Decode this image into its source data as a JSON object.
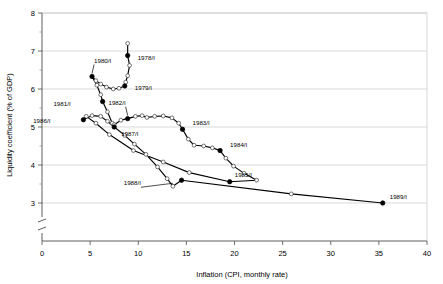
{
  "chart_data": {
    "type": "line",
    "title": "",
    "xlabel": "Inflation (CPI, monthly rate)",
    "ylabel": "Liquidity coefficient (% of GDP)",
    "xlim": [
      0,
      40
    ],
    "ylim": [
      3,
      8
    ],
    "y_axis_break": true,
    "grid": "horizontal",
    "legend": "none",
    "xticks": [
      0,
      5,
      10,
      15,
      20,
      25,
      30,
      35,
      40
    ],
    "xtick_labels": [
      "0",
      "5",
      "10",
      "15",
      "20",
      "25",
      "30",
      "35",
      "40"
    ],
    "yticks": [
      3,
      4,
      5,
      6,
      7,
      8
    ],
    "ytick_labels": [
      "3",
      "4",
      "5",
      "6",
      "7",
      "8"
    ],
    "series": [
      {
        "name": "Liquidity coefficient vs inflation (quarterly path 1978/I-1989/I)",
        "marker_open": "open circle (quarterly observations)",
        "marker_filled": "filled square (first quarter of year, labelled)",
        "points": [
          {
            "x": 8.9,
            "y": 7.2,
            "marker": "open",
            "label": ""
          },
          {
            "x": 8.9,
            "y": 6.88,
            "marker": "filled",
            "label": "1978/I"
          },
          {
            "x": 9.1,
            "y": 6.62,
            "marker": "open",
            "label": ""
          },
          {
            "x": 8.9,
            "y": 6.35,
            "marker": "open",
            "label": ""
          },
          {
            "x": 8.7,
            "y": 6.18,
            "marker": "open",
            "label": ""
          },
          {
            "x": 8.6,
            "y": 6.08,
            "marker": "filled",
            "label": "1979/I"
          },
          {
            "x": 8.0,
            "y": 6.02,
            "marker": "open",
            "label": ""
          },
          {
            "x": 7.4,
            "y": 6.0,
            "marker": "open",
            "label": ""
          },
          {
            "x": 6.7,
            "y": 6.05,
            "marker": "open",
            "label": ""
          },
          {
            "x": 6.1,
            "y": 6.13,
            "marker": "open",
            "label": ""
          },
          {
            "x": 5.6,
            "y": 6.22,
            "marker": "open",
            "label": ""
          },
          {
            "x": 5.2,
            "y": 6.33,
            "marker": "filled",
            "label": "1980/I"
          },
          {
            "x": 5.7,
            "y": 6.1,
            "marker": "open",
            "label": ""
          },
          {
            "x": 6.1,
            "y": 5.85,
            "marker": "open",
            "label": ""
          },
          {
            "x": 6.3,
            "y": 5.67,
            "marker": "filled",
            "label": "1981/I"
          },
          {
            "x": 6.8,
            "y": 5.4,
            "marker": "open",
            "label": ""
          },
          {
            "x": 7.3,
            "y": 5.1,
            "marker": "open",
            "label": ""
          },
          {
            "x": 7.5,
            "y": 5.06,
            "marker": "open",
            "label": ""
          },
          {
            "x": 8.2,
            "y": 5.18,
            "marker": "open",
            "label": ""
          },
          {
            "x": 8.9,
            "y": 5.22,
            "marker": "filled",
            "label": "1982/I"
          },
          {
            "x": 9.7,
            "y": 5.28,
            "marker": "open",
            "label": ""
          },
          {
            "x": 10.4,
            "y": 5.3,
            "marker": "open",
            "label": ""
          },
          {
            "x": 10.9,
            "y": 5.25,
            "marker": "open",
            "label": ""
          },
          {
            "x": 11.7,
            "y": 5.28,
            "marker": "open",
            "label": ""
          },
          {
            "x": 12.6,
            "y": 5.29,
            "marker": "open",
            "label": ""
          },
          {
            "x": 13.5,
            "y": 5.24,
            "marker": "open",
            "label": ""
          },
          {
            "x": 14.2,
            "y": 5.1,
            "marker": "open",
            "label": ""
          },
          {
            "x": 14.6,
            "y": 4.94,
            "marker": "filled",
            "label": "1983/I"
          },
          {
            "x": 15.2,
            "y": 4.68,
            "marker": "open",
            "label": ""
          },
          {
            "x": 15.8,
            "y": 4.52,
            "marker": "open",
            "label": ""
          },
          {
            "x": 16.8,
            "y": 4.5,
            "marker": "open",
            "label": ""
          },
          {
            "x": 17.7,
            "y": 4.45,
            "marker": "open",
            "label": ""
          },
          {
            "x": 18.5,
            "y": 4.38,
            "marker": "filled",
            "label": "1984/I"
          },
          {
            "x": 19.1,
            "y": 4.18,
            "marker": "open",
            "label": ""
          },
          {
            "x": 19.9,
            "y": 3.97,
            "marker": "open",
            "label": ""
          },
          {
            "x": 21.0,
            "y": 3.78,
            "marker": "open",
            "label": ""
          },
          {
            "x": 22.3,
            "y": 3.6,
            "marker": "open",
            "label": ""
          },
          {
            "x": 19.5,
            "y": 3.56,
            "marker": "filled",
            "label": "1985/I"
          },
          {
            "x": 15.3,
            "y": 3.8,
            "marker": "open",
            "label": ""
          },
          {
            "x": 12.6,
            "y": 4.08,
            "marker": "open",
            "label": ""
          },
          {
            "x": 9.5,
            "y": 4.38,
            "marker": "open",
            "label": ""
          },
          {
            "x": 7.0,
            "y": 4.8,
            "marker": "open",
            "label": ""
          },
          {
            "x": 5.6,
            "y": 5.1,
            "marker": "open",
            "label": ""
          },
          {
            "x": 4.6,
            "y": 5.28,
            "marker": "open",
            "label": ""
          },
          {
            "x": 4.3,
            "y": 5.19,
            "marker": "filled",
            "label": "1986/I"
          },
          {
            "x": 5.2,
            "y": 5.3,
            "marker": "open",
            "label": ""
          },
          {
            "x": 6.1,
            "y": 5.28,
            "marker": "open",
            "label": ""
          },
          {
            "x": 6.8,
            "y": 5.15,
            "marker": "open",
            "label": ""
          },
          {
            "x": 7.5,
            "y": 5.0,
            "marker": "filled",
            "label": "1987/I"
          },
          {
            "x": 8.6,
            "y": 4.78,
            "marker": "open",
            "label": ""
          },
          {
            "x": 9.6,
            "y": 4.55,
            "marker": "open",
            "label": ""
          },
          {
            "x": 10.8,
            "y": 4.28,
            "marker": "open",
            "label": ""
          },
          {
            "x": 12.0,
            "y": 3.95,
            "marker": "open",
            "label": ""
          },
          {
            "x": 13.0,
            "y": 3.64,
            "marker": "open",
            "label": ""
          },
          {
            "x": 13.6,
            "y": 3.44,
            "marker": "open",
            "label": "1988/I"
          },
          {
            "x": 14.5,
            "y": 3.6,
            "marker": "filled",
            "label": ""
          },
          {
            "x": 25.9,
            "y": 3.24,
            "marker": "open",
            "label": ""
          },
          {
            "x": 35.4,
            "y": 3.0,
            "marker": "filled",
            "label": "1989/I"
          }
        ]
      }
    ],
    "annotations": [
      {
        "text": "1978/I",
        "x": 8.9,
        "y": 6.88,
        "dx": 10,
        "dy": 2,
        "leader": false
      },
      {
        "text": "1979/I",
        "x": 8.6,
        "y": 6.08,
        "dx": 10,
        "dy": 2,
        "leader": false
      },
      {
        "text": "1980/I",
        "x": 5.2,
        "y": 6.33,
        "dx": 2,
        "dy": -16,
        "leader": true
      },
      {
        "text": "1981/I",
        "x": 6.3,
        "y": 5.67,
        "dx": -32,
        "dy": 2,
        "leader": false
      },
      {
        "text": "1982/I",
        "x": 8.9,
        "y": 5.22,
        "dx": -2,
        "dy": -16,
        "leader": true
      },
      {
        "text": "1983/I",
        "x": 14.6,
        "y": 4.94,
        "dx": 10,
        "dy": -6,
        "leader": false
      },
      {
        "text": "1984/I",
        "x": 18.5,
        "y": 4.38,
        "dx": 10,
        "dy": -6,
        "leader": false
      },
      {
        "text": "1985/I",
        "x": 19.5,
        "y": 3.56,
        "dx": 5,
        "dy": -7,
        "leader": false
      },
      {
        "text": "1986/I",
        "x": 4.3,
        "y": 5.19,
        "dx": -33,
        "dy": 1,
        "leader": false
      },
      {
        "text": "1987/I",
        "x": 7.5,
        "y": 5.0,
        "dx": 7,
        "dy": 7,
        "leader": false
      },
      {
        "text": "1988/I",
        "x": 13.6,
        "y": 3.44,
        "dx": -32,
        "dy": -3,
        "leader": true
      },
      {
        "text": "1989/I",
        "x": 35.4,
        "y": 3.0,
        "dx": 7,
        "dy": -6,
        "leader": false
      }
    ]
  },
  "axes": {
    "x_title": "Inflation (CPI, monthly rate)",
    "y_title": "Liquidity coefficient (% of GDP)"
  },
  "colors": {
    "line": "#000000",
    "grid": "#bfbfbf",
    "axis": "#4d4d4d",
    "marker_fill": "#ffffff",
    "background": "#ffffff"
  }
}
